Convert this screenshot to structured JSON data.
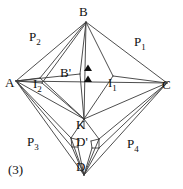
{
  "figure": {
    "number_label": "(3)",
    "caption_visible": false,
    "background_color": "#ffffff",
    "stroke_color": "#3a3a3a",
    "marker_color": "#101010",
    "width": 183,
    "height": 189
  },
  "vertices": [
    {
      "id": "A",
      "label": "A",
      "x": 16,
      "y": 81,
      "label_x": 6,
      "label_y": 84
    },
    {
      "id": "B",
      "label": "B",
      "x": 86,
      "y": 22,
      "label_x": 80,
      "label_y": 12
    },
    {
      "id": "C",
      "label": "C",
      "x": 167,
      "y": 83,
      "label_x": 163,
      "label_y": 86
    },
    {
      "id": "D",
      "label": "D",
      "x": 84,
      "y": 175,
      "label_x": 78,
      "label_y": 166
    },
    {
      "id": "K",
      "label": "K",
      "x": 84,
      "y": 119,
      "label_x": 78,
      "label_y": 121
    },
    {
      "id": "Bp",
      "label": "B'",
      "x": 80,
      "y": 74,
      "label_x": 62,
      "label_y": 70
    },
    {
      "id": "Dp",
      "label": "D'",
      "x": 84,
      "y": 143,
      "label_x": 78,
      "label_y": 137
    },
    {
      "id": "I1",
      "label": "I",
      "label_sub": "1",
      "x": 113,
      "y": 76,
      "label_x": 110,
      "label_y": 79
    },
    {
      "id": "I2",
      "label": "I",
      "label_sub": "2",
      "x": 40,
      "y": 78,
      "label_x": 34,
      "label_y": 80
    }
  ],
  "patch_labels": [
    {
      "id": "P1",
      "label": "P",
      "label_sub": "1",
      "x": 139,
      "y": 41
    },
    {
      "id": "P2",
      "label": "P",
      "label_sub": "2",
      "x": 29,
      "y": 36
    },
    {
      "id": "P3",
      "label": "P",
      "label_sub": "3",
      "x": 28,
      "y": 138
    },
    {
      "id": "P4",
      "label": "P",
      "label_sub": "4",
      "x": 129,
      "y": 140
    }
  ],
  "markers": [
    {
      "id": "marker-upper",
      "shape": "filled-triangle",
      "x": 88,
      "y": 69
    },
    {
      "id": "marker-lower",
      "shape": "filled-triangle",
      "x": 88,
      "y": 80
    }
  ],
  "edges": [
    {
      "id": "A-B",
      "from": [
        16,
        81
      ],
      "to": [
        86,
        22
      ]
    },
    {
      "id": "B-C",
      "from": [
        86,
        22
      ],
      "to": [
        167,
        83
      ]
    },
    {
      "id": "A-C-mid",
      "from": [
        16,
        81
      ],
      "to": [
        167,
        83
      ]
    },
    {
      "id": "A-K",
      "from": [
        16,
        81
      ],
      "to": [
        84,
        119
      ]
    },
    {
      "id": "K-C",
      "from": [
        84,
        119
      ],
      "to": [
        167,
        83
      ]
    },
    {
      "id": "B-K-left",
      "from": [
        86,
        22
      ],
      "to": [
        84,
        119
      ]
    },
    {
      "id": "A-Bp",
      "from": [
        16,
        81
      ],
      "to": [
        80,
        74
      ]
    },
    {
      "id": "Bp-B",
      "from": [
        80,
        74
      ],
      "to": [
        86,
        22
      ]
    },
    {
      "id": "Bp-K",
      "from": [
        80,
        74
      ],
      "to": [
        84,
        119
      ]
    },
    {
      "id": "I1-B",
      "from": [
        113,
        76
      ],
      "to": [
        86,
        22
      ]
    },
    {
      "id": "I1-K",
      "from": [
        113,
        76
      ],
      "to": [
        84,
        119
      ]
    },
    {
      "id": "I1-C",
      "from": [
        113,
        76
      ],
      "to": [
        167,
        83
      ]
    },
    {
      "id": "I2-B",
      "from": [
        40,
        78
      ],
      "to": [
        86,
        22
      ]
    },
    {
      "id": "I2-K",
      "from": [
        40,
        78
      ],
      "to": [
        84,
        119
      ]
    },
    {
      "id": "K-D",
      "from": [
        84,
        119
      ],
      "to": [
        84,
        175
      ]
    },
    {
      "id": "A-D",
      "from": [
        16,
        81
      ],
      "to": [
        84,
        175
      ]
    },
    {
      "id": "D-C",
      "from": [
        84,
        175
      ],
      "to": [
        167,
        83
      ]
    },
    {
      "id": "A-Dp",
      "from": [
        16,
        81
      ],
      "to": [
        72,
        142
      ]
    },
    {
      "id": "Dp-C",
      "from": [
        99,
        142
      ],
      "to": [
        167,
        83
      ]
    }
  ]
}
